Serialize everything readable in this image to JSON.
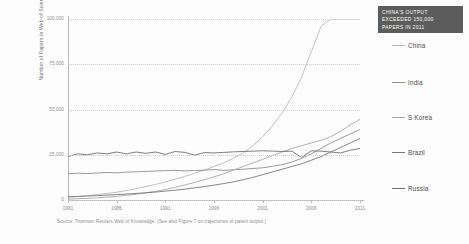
{
  "figure": {
    "ytitle": "Number of Papers in Web of Science, Annually",
    "caption": "Source: Thomson Reuters Web of Knowledge. (See also Figure 7 on trajectories of patent output.)"
  },
  "callout": {
    "line1": "CHINA'S OUTPUT",
    "line2": "EXCEEDED 150,000",
    "line3": "PAPERS IN 2011"
  },
  "legend": [
    {
      "label": "China",
      "color": "#b9b9b9",
      "top": 42
    },
    {
      "label": "India",
      "color": "#8f8f8f",
      "top": 79
    },
    {
      "label": "S Korea",
      "color": "#a8a8a8",
      "top": 114
    },
    {
      "label": "Brazil",
      "color": "#787878",
      "top": 149
    },
    {
      "label": "Russia",
      "color": "#6f6f6f",
      "top": 185
    }
  ],
  "chart_data": {
    "type": "line",
    "title": "",
    "xlabel": "",
    "ylabel": "Number of Papers in Web of Science, Annually",
    "xlim": [
      1981,
      2011
    ],
    "ylim": [
      0,
      100000
    ],
    "ytick_labels": [
      "100,000",
      "75,000",
      "50,000",
      "25,000",
      "0"
    ],
    "ytick_values": [
      100000,
      75000,
      50000,
      25000,
      0
    ],
    "xtick_labels": [
      "1981",
      "1986",
      "1991",
      "1996",
      "2001",
      "2006",
      "2011"
    ],
    "xtick_values": [
      1981,
      1986,
      1991,
      1996,
      2001,
      2006,
      2011
    ],
    "grid": true,
    "legend_position": "right",
    "annotation": "CHINA'S OUTPUT EXCEEDED 150,000 PAPERS IN 2011",
    "note": "China series is clipped at the 100,000 axis maximum after 2008",
    "x": [
      1981,
      1982,
      1983,
      1984,
      1985,
      1986,
      1987,
      1988,
      1989,
      1990,
      1991,
      1992,
      1993,
      1994,
      1995,
      1996,
      1997,
      1998,
      1999,
      2000,
      2001,
      2002,
      2003,
      2004,
      2005,
      2006,
      2007,
      2008,
      2009,
      2010,
      2011
    ],
    "series": [
      {
        "name": "China",
        "color": "#b9b9b9",
        "values": [
          1500,
          1900,
          2400,
          3000,
          3600,
          4300,
          5200,
          6300,
          7400,
          8600,
          9900,
          11500,
          13000,
          14800,
          16500,
          18500,
          20500,
          23000,
          26000,
          30000,
          35000,
          41000,
          48000,
          57000,
          68000,
          82000,
          96000,
          100000,
          100000,
          100000,
          100000
        ]
      },
      {
        "name": "India",
        "color": "#8f8f8f",
        "values": [
          14500,
          14800,
          14600,
          14900,
          15200,
          15000,
          15400,
          15600,
          15800,
          16000,
          16200,
          16400,
          16100,
          16300,
          16500,
          16800,
          16400,
          16700,
          17000,
          17400,
          17800,
          18600,
          19500,
          21000,
          23000,
          25500,
          28500,
          31500,
          34000,
          36500,
          39000
        ]
      },
      {
        "name": "S Korea",
        "color": "#a8a8a8",
        "values": [
          500,
          700,
          900,
          1200,
          1600,
          2000,
          2600,
          3200,
          3900,
          4800,
          5800,
          7000,
          8300,
          9700,
          11200,
          12800,
          14500,
          16500,
          18500,
          20500,
          22500,
          24500,
          26500,
          28500,
          30000,
          31500,
          33000,
          35000,
          38000,
          41500,
          44500
        ]
      },
      {
        "name": "Brazil",
        "color": "#787878",
        "values": [
          1800,
          2000,
          2200,
          2400,
          2700,
          3000,
          3300,
          3600,
          4000,
          4400,
          4900,
          5400,
          6000,
          6700,
          7400,
          8200,
          9100,
          10000,
          11200,
          12500,
          14000,
          15500,
          17000,
          18500,
          20000,
          22000,
          24000,
          26500,
          29000,
          31500,
          34000
        ]
      },
      {
        "name": "Russia",
        "color": "#6f6f6f",
        "values": [
          24000,
          25500,
          25000,
          26000,
          25500,
          26500,
          25500,
          26500,
          25800,
          26500,
          25200,
          26800,
          26300,
          24800,
          26200,
          26000,
          26300,
          26600,
          26800,
          27000,
          27200,
          27000,
          26800,
          27000,
          23500,
          27200,
          27000,
          26500,
          26000,
          27500,
          28500
        ]
      }
    ]
  }
}
